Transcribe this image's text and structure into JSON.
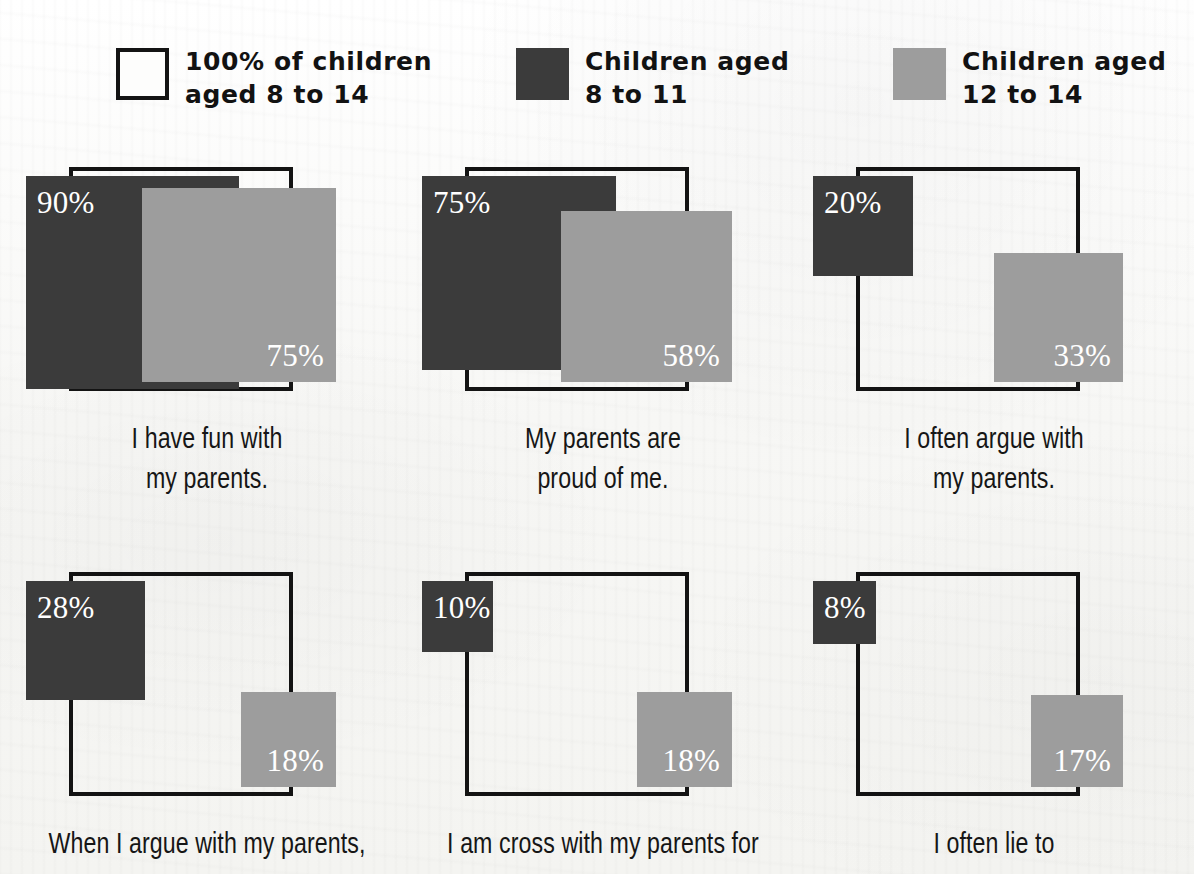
{
  "colors": {
    "dark": "#3b3b3b",
    "light": "#9d9d9d",
    "outline": "#131313",
    "value_text": "#ffffff",
    "paper": "#fbfbfa",
    "caption_text": "#161616"
  },
  "legend": {
    "items": [
      {
        "label": "100% of children\naged 8 to 14",
        "swatch": "outline-square-swatch",
        "color": "#ffffff",
        "style": "outline"
      },
      {
        "label": "Children aged\n8 to 11",
        "swatch": "dark-square-swatch",
        "color": "#3b3b3b",
        "style": "filled"
      },
      {
        "label": "Children aged\n12 to 14",
        "swatch": "light-gray-square-swatch",
        "color": "#9d9d9d",
        "style": "filled"
      }
    ]
  },
  "chart_data": {
    "type": "bar",
    "title": "",
    "subtitle": "",
    "xlabel": "",
    "ylabel": "",
    "encoding": "square area proportional to percentage; side length scales with sqrt(percent/100) of the 100% reference square",
    "reference": {
      "label": "100% of children aged 8 to 14",
      "value": 100,
      "unit": "%"
    },
    "series": [
      {
        "name": "Children aged 8 to 11",
        "color": "#3b3b3b",
        "values": [
          90,
          75,
          20,
          28,
          10,
          8
        ]
      },
      {
        "name": "Children aged 12 to 14",
        "color": "#9d9d9d",
        "values": [
          75,
          58,
          33,
          18,
          18,
          17
        ]
      }
    ],
    "categories": [
      "I have fun with my parents.",
      "My parents are proud of me.",
      "I often argue with my parents.",
      "When I argue with my parents,",
      "I am cross with my parents for",
      "I often lie to"
    ],
    "legend_position": "top",
    "grid": false,
    "ylim": [
      0,
      100
    ]
  },
  "cells": [
    {
      "caption": "I have fun with\nmy parents.",
      "dark": {
        "value": "90%",
        "pct": 90
      },
      "light": {
        "value": "75%",
        "pct": 75
      }
    },
    {
      "caption": "My parents are\nproud of me.",
      "dark": {
        "value": "75%",
        "pct": 75
      },
      "light": {
        "value": "58%",
        "pct": 58
      }
    },
    {
      "caption": "I often argue with\nmy parents.",
      "dark": {
        "value": "20%",
        "pct": 20
      },
      "light": {
        "value": "33%",
        "pct": 33
      }
    },
    {
      "caption": "When I argue with my parents,",
      "dark": {
        "value": "28%",
        "pct": 28
      },
      "light": {
        "value": "18%",
        "pct": 18
      }
    },
    {
      "caption": "I am cross with my parents for",
      "dark": {
        "value": "10%",
        "pct": 10
      },
      "light": {
        "value": "18%",
        "pct": 18
      }
    },
    {
      "caption": "I often lie to",
      "dark": {
        "value": "8%",
        "pct": 8
      },
      "light": {
        "value": "17%",
        "pct": 17
      }
    }
  ]
}
